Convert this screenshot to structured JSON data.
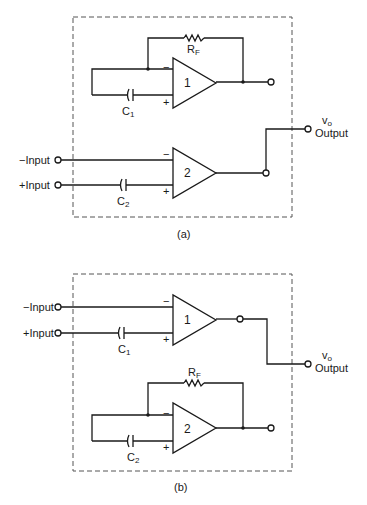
{
  "panels": [
    {
      "id": "a",
      "caption": "(a)",
      "inputs": {
        "minus_label": "−Input",
        "plus_label": "+Input"
      },
      "output": {
        "symbol": "v",
        "symbol_sub": "o",
        "label": "Output"
      },
      "opamps": [
        {
          "number": "1",
          "minus": "−",
          "plus": "+"
        },
        {
          "number": "2",
          "minus": "−",
          "plus": "+"
        }
      ],
      "components": {
        "resistor": {
          "label": "R",
          "sub": "F"
        },
        "cap_top": {
          "label": "C",
          "sub": "1"
        },
        "cap_bottom": {
          "label": "C",
          "sub": "2"
        }
      }
    },
    {
      "id": "b",
      "caption": "(b)",
      "inputs": {
        "minus_label": "−Input",
        "plus_label": "+Input"
      },
      "output": {
        "symbol": "v",
        "symbol_sub": "o",
        "label": "Output"
      },
      "opamps": [
        {
          "number": "1",
          "minus": "−",
          "plus": "+"
        },
        {
          "number": "2",
          "minus": "−",
          "plus": "+"
        }
      ],
      "components": {
        "resistor": {
          "label": "R",
          "sub": "F"
        },
        "cap_top": {
          "label": "C",
          "sub": "1"
        },
        "cap_bottom": {
          "label": "C",
          "sub": "2"
        }
      }
    }
  ]
}
